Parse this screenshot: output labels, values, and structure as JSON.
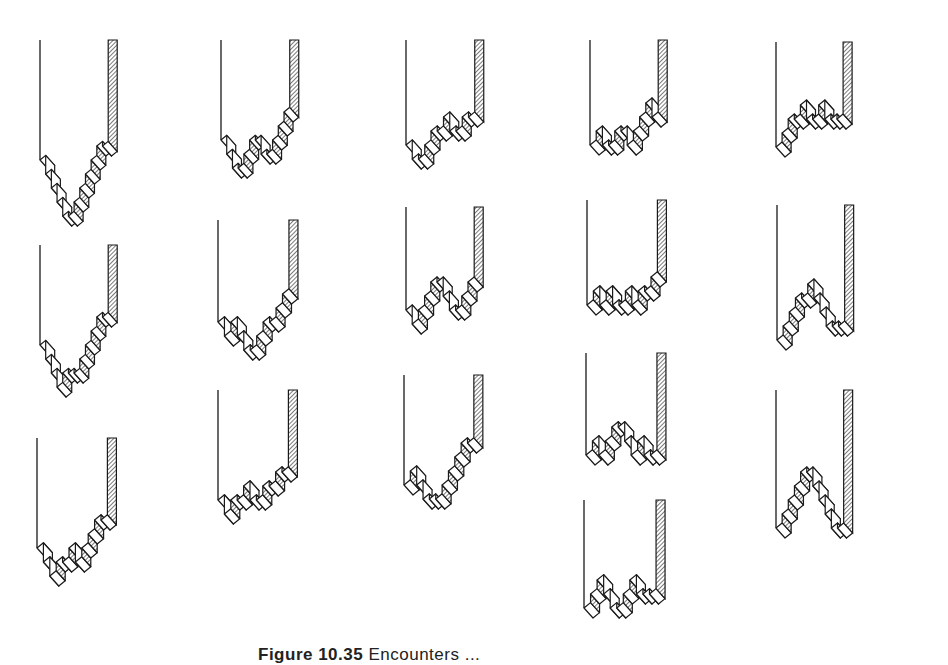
{
  "figure": {
    "caption_label": "Figure 10.35",
    "caption_text": "Encounters ...",
    "colors": {
      "ink": "#1a1a1a",
      "paper": "#ffffff",
      "hatch": "#333333"
    },
    "unit": {
      "dx": 9.2,
      "dy": 5.2,
      "rise": 14,
      "depth_x": 10,
      "depth_y": 11
    },
    "panels": [
      {
        "id": "r1c1",
        "x": 40,
        "top": 40,
        "base": 160,
        "right": 174,
        "levels": [
          0,
          -1,
          -2,
          -3,
          -4,
          -4,
          -3,
          -2,
          -1,
          0,
          1,
          1
        ]
      },
      {
        "id": "r1c2",
        "x": 221,
        "top": 40,
        "base": 140,
        "right": 356,
        "levels": [
          0,
          -1,
          -2,
          -2,
          -1,
          0,
          0,
          -1,
          -1,
          0,
          1,
          2
        ]
      },
      {
        "id": "r1c3",
        "x": 406,
        "top": 40,
        "base": 145,
        "right": 541,
        "levels": [
          0,
          -1,
          -1,
          0,
          1,
          1,
          2,
          1,
          1,
          2,
          2
        ]
      },
      {
        "id": "r1c4",
        "x": 590,
        "top": 40,
        "base": 145,
        "right": 724,
        "levels": [
          0,
          1,
          0,
          0,
          1,
          1,
          0,
          1,
          2,
          3,
          2
        ]
      },
      {
        "id": "r1c5",
        "x": 776,
        "top": 42,
        "base": 147,
        "right": 908,
        "levels": [
          0,
          1,
          2,
          2,
          3,
          2,
          2,
          3,
          2,
          2,
          2
        ]
      },
      {
        "id": "r2c1",
        "x": 40,
        "top": 245,
        "base": 345,
        "right": 174,
        "levels": [
          0,
          -1,
          -2,
          -3,
          -2,
          -2,
          -2,
          -1,
          0,
          1,
          2,
          2
        ]
      },
      {
        "id": "r2c2",
        "x": 218,
        "top": 220,
        "base": 322,
        "right": 357,
        "levels": [
          0,
          -1,
          0,
          -1,
          -2,
          -2,
          -1,
          0,
          0,
          1,
          2
        ]
      },
      {
        "id": "r2c3",
        "x": 406,
        "top": 207,
        "base": 310,
        "right": 540,
        "levels": [
          0,
          -1,
          0,
          1,
          2,
          2,
          1,
          0,
          0,
          1,
          2
        ]
      },
      {
        "id": "r2c4",
        "x": 587,
        "top": 200,
        "base": 305,
        "right": 725,
        "levels": [
          0,
          1,
          0,
          1,
          0,
          0,
          1,
          0,
          1,
          1,
          2
        ]
      },
      {
        "id": "r2c5",
        "x": 777,
        "top": 205,
        "base": 340,
        "right": 910,
        "levels": [
          0,
          1,
          2,
          3,
          3,
          4,
          3,
          2,
          1,
          1,
          1
        ]
      },
      {
        "id": "r3c1",
        "x": 37,
        "top": 438,
        "base": 548,
        "right": 175,
        "levels": [
          0,
          -1,
          -2,
          -1,
          -1,
          0,
          -1,
          0,
          1,
          2,
          2
        ]
      },
      {
        "id": "r3c2",
        "x": 218,
        "top": 390,
        "base": 500,
        "right": 356,
        "levels": [
          0,
          -1,
          0,
          0,
          1,
          0,
          0,
          1,
          1,
          2,
          2
        ]
      },
      {
        "id": "r3c3",
        "x": 404,
        "top": 375,
        "base": 485,
        "right": 541,
        "levels": [
          0,
          1,
          0,
          -1,
          -1,
          -1,
          0,
          1,
          2,
          3,
          3
        ]
      },
      {
        "id": "r3c4",
        "x": 586,
        "top": 353,
        "base": 455,
        "right": 725,
        "levels": [
          0,
          1,
          0,
          1,
          2,
          2,
          1,
          0,
          1,
          0,
          0
        ]
      },
      {
        "id": "r3c5",
        "x": 776,
        "top": 390,
        "base": 528,
        "right": 909,
        "levels": [
          0,
          1,
          2,
          3,
          4,
          4,
          3,
          2,
          1,
          0,
          0
        ]
      },
      {
        "id": "r4c4",
        "x": 584,
        "top": 500,
        "base": 608,
        "right": 725,
        "levels": [
          0,
          1,
          2,
          1,
          0,
          0,
          1,
          2,
          1,
          1,
          1
        ]
      }
    ]
  }
}
